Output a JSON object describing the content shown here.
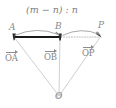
{
  "figure": {
    "title_expression": "(m − n) : n",
    "points": [
      {
        "id": "A",
        "label": "A",
        "x": 14,
        "y": 37
      },
      {
        "id": "B",
        "label": "B",
        "x": 60,
        "y": 36
      },
      {
        "id": "P",
        "label": "P",
        "x": 101,
        "y": 36
      },
      {
        "id": "O",
        "label": "O",
        "x": 59,
        "y": 96
      }
    ],
    "vectors": [
      {
        "id": "OA",
        "label": "OA",
        "from": "O",
        "to": "A"
      },
      {
        "id": "OB",
        "label": "OB",
        "from": "O",
        "to": "B"
      },
      {
        "id": "OP",
        "label": "OP",
        "from": "O",
        "to": "P"
      }
    ],
    "segments": [
      {
        "id": "AB",
        "style": "solid",
        "from": "A",
        "to": "B"
      },
      {
        "id": "BP",
        "style": "dotted",
        "from": "B",
        "to": "P"
      }
    ],
    "arcs": [
      {
        "id": "arc-AB",
        "from": "A",
        "to": "B",
        "arrow_at": "B"
      },
      {
        "id": "arc-BP",
        "from": "B",
        "to": "P",
        "arrow_at": "P"
      }
    ],
    "colors": {
      "ray": "#c9c9c9",
      "label": "#8a8a8a",
      "arc": "#9a9a9a",
      "solid_segment": "#1a1a1a",
      "dotted_segment": "#bdbdbd",
      "background": "#ffffff"
    }
  }
}
